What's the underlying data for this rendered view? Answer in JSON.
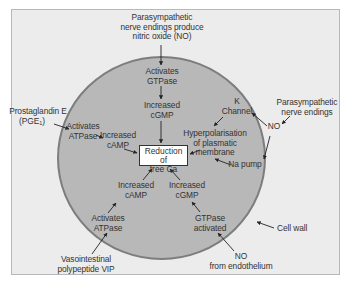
{
  "colors": {
    "background": "#ececec",
    "cell_fill": "#b8b8b8",
    "cell_outline": "#7d7d7d",
    "box_fill": "#ffffff",
    "text": "#333333"
  },
  "diagram": {
    "top_source": [
      "Parasympathetic",
      "nerve endings produce",
      "nitric oxide (NO)"
    ],
    "activates_gtpase": [
      "Activates",
      "GTPase"
    ],
    "increased_cgmp_top": [
      "Increased",
      "cGMP"
    ],
    "prostaglandin": [
      "Prostaglandin E",
      "(PGE",
      "1",
      ")"
    ],
    "activates_atpase_left": [
      "Activates",
      "ATPase"
    ],
    "increased_camp_left": [
      "Increased",
      "cAMP"
    ],
    "central_box": [
      "Reduction of",
      "free Ca"
    ],
    "k_channel": [
      "K",
      "Channel"
    ],
    "parasympathetic_right": [
      "Parasympathetic",
      "nerve endings"
    ],
    "no_right": "NO",
    "hyperpolarisation": [
      "Hyperpolarisation",
      "of plasmatic",
      "membrane"
    ],
    "na_pump": "Na pump",
    "increased_camp_bottom": [
      "Increased",
      "cAMP"
    ],
    "increased_cgmp_bottom": [
      "Increased",
      "cGMP"
    ],
    "activates_atpase_bottom": [
      "Activates",
      "ATPase"
    ],
    "gtpase_activated": [
      "GTPase",
      "activated"
    ],
    "cell_wall": "Cell wall",
    "vip": [
      "Vasointestinal",
      "polypeptide VIP"
    ],
    "no_endothelium": [
      "NO",
      "from endothelium"
    ]
  }
}
